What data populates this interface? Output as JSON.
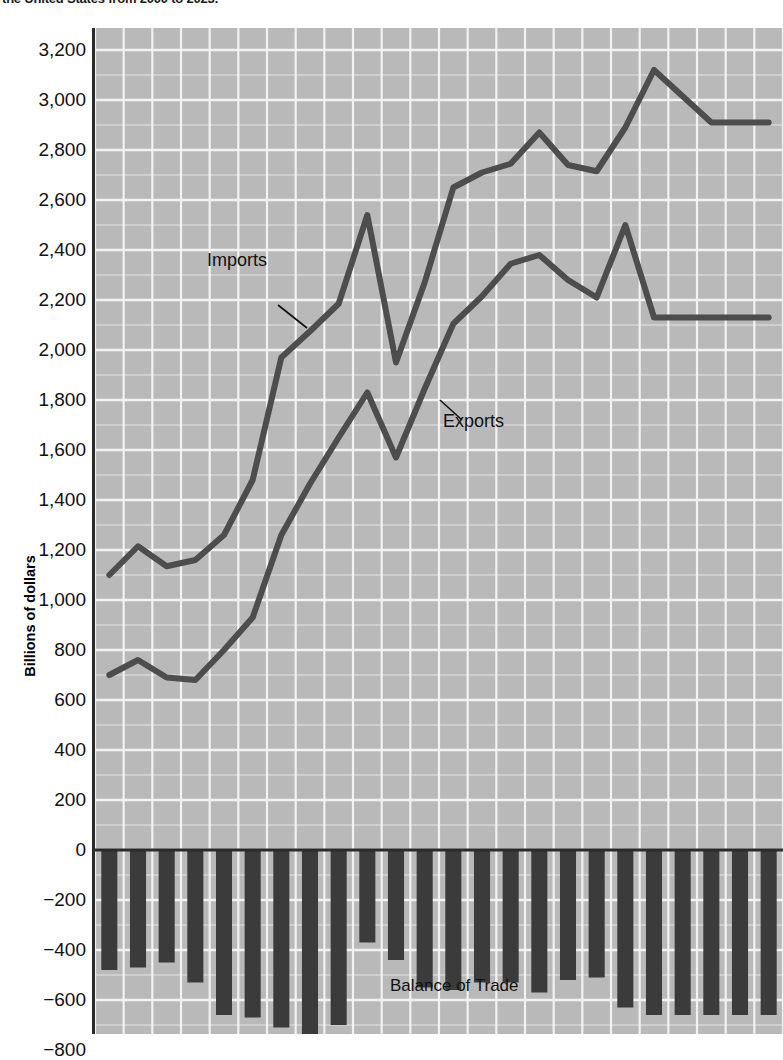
{
  "title": "the United States from 2000 to 2023.",
  "axis": {
    "ylabel": "Billions of dollars",
    "yticks": [
      "3,200",
      "3,000",
      "2,800",
      "2,600",
      "2,400",
      "2,200",
      "2,000",
      "1,800",
      "1,600",
      "1,400",
      "1,200",
      "1,000",
      "800",
      "600",
      "400",
      "200",
      "0",
      "−200",
      "−400",
      "−600",
      "−800"
    ]
  },
  "annotations": {
    "imports": "Imports",
    "exports": "Exports",
    "balance": "Balance of Trade"
  },
  "colors": {
    "plot_background": "#b9b9b9",
    "gridline": "#f2f2f2",
    "line_series": "#4d4d4d",
    "bar_fill": "#3b3b3b",
    "axis": "#2b2b2b",
    "text": "#111111"
  },
  "chart_data": {
    "type": "line",
    "title": "the United States from 2000 to 2023.",
    "xlabel": "",
    "ylabel": "Billions of dollars",
    "ylim": [
      -800,
      3200
    ],
    "ytick_step": 200,
    "grid": true,
    "legend": "inline-annotations",
    "categories": [
      2000,
      2001,
      2002,
      2003,
      2004,
      2005,
      2006,
      2007,
      2008,
      2009,
      2010,
      2011,
      2012,
      2013,
      2014,
      2015,
      2016,
      2017,
      2018,
      2019,
      2020,
      2021,
      2022,
      2023
    ],
    "series": [
      {
        "name": "Imports",
        "values": [
          1100,
          1215,
          1135,
          1160,
          1260,
          1480,
          1970,
          2075,
          2185,
          2540,
          1950,
          2270,
          2650,
          2710,
          2745,
          2870,
          2740,
          2715,
          2890,
          3120,
          3015,
          2910,
          2910,
          2910
        ]
      },
      {
        "name": "Exports",
        "values": [
          700,
          760,
          690,
          680,
          800,
          930,
          1260,
          1465,
          1650,
          1830,
          1570,
          1845,
          2105,
          2215,
          2345,
          2380,
          2280,
          2210,
          2500,
          2130,
          2130,
          2130,
          2130,
          2130
        ]
      },
      {
        "name": "Balance of Trade",
        "type": "bar",
        "values": [
          -480,
          -470,
          -450,
          -530,
          -660,
          -670,
          -710,
          -780,
          -700,
          -370,
          -440,
          -550,
          -560,
          -530,
          -530,
          -570,
          -520,
          -510,
          -630,
          -660,
          -660,
          -660,
          -660,
          -660
        ]
      }
    ]
  }
}
